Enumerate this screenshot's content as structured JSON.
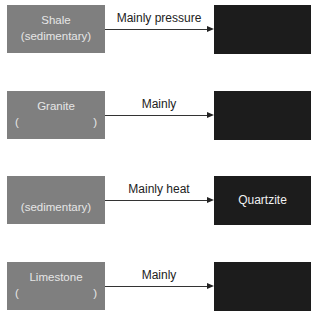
{
  "rows": [
    {
      "source": {
        "line1": "Shale",
        "line2": "(sedimentary)"
      },
      "arrow_label": "Mainly pressure",
      "target": {
        "label": ""
      }
    },
    {
      "source": {
        "line1": "Granite",
        "paren_left": "(",
        "paren_right": ")"
      },
      "arrow_label": "Mainly",
      "target": {
        "label": ""
      }
    },
    {
      "source": {
        "line1": "(sedimentary)"
      },
      "arrow_label": "Mainly heat",
      "target": {
        "label": "Quartzite"
      }
    },
    {
      "source": {
        "line1": "Limestone",
        "paren_left": "(",
        "paren_right": ")"
      },
      "arrow_label": "Mainly",
      "target": {
        "label": ""
      }
    }
  ],
  "colors": {
    "source_box": "#7f7f7f",
    "target_box": "#1c1c1c",
    "arrow": "#222222"
  }
}
